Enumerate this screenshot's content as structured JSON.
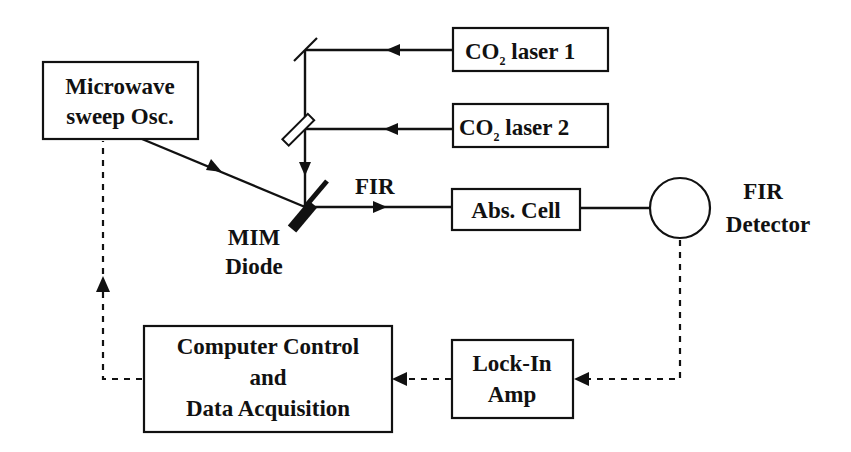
{
  "diagram": {
    "type": "experimental-setup-block-diagram",
    "colors": {
      "ink": "#111111",
      "background": "#ffffff"
    },
    "nodes": {
      "microwave": {
        "line1": "Microwave",
        "line2": "sweep Osc."
      },
      "laser1": {
        "prefix": "CO",
        "sub": "2",
        "suffix": " laser 1"
      },
      "laser2": {
        "prefix": "CO",
        "sub": "2",
        "suffix": " laser 2"
      },
      "mim": {
        "line1": "MIM",
        "line2": "Diode"
      },
      "fir_beam": {
        "label": "FIR"
      },
      "abs_cell": {
        "label": "Abs. Cell"
      },
      "detector": {
        "line1": "FIR",
        "line2": "Detector"
      },
      "lockin": {
        "line1": "Lock-In",
        "line2": "Amp"
      },
      "computer": {
        "line1": "Computer Control",
        "line2": "and",
        "line3": "Data Acquisition"
      }
    },
    "edges": [
      {
        "from": "laser1",
        "to": "mirror",
        "style": "solid",
        "arrow": "left"
      },
      {
        "from": "laser2",
        "to": "beamsplitter",
        "style": "solid",
        "arrow": "left"
      },
      {
        "from": "mirror",
        "to": "mim",
        "style": "solid",
        "arrow": "down"
      },
      {
        "from": "microwave",
        "to": "mim",
        "style": "solid",
        "arrow": "diagonal"
      },
      {
        "from": "mim",
        "to": "abs_cell",
        "style": "solid",
        "arrow": "right",
        "label": "FIR"
      },
      {
        "from": "abs_cell",
        "to": "detector",
        "style": "solid"
      },
      {
        "from": "detector",
        "to": "lockin",
        "style": "dashed",
        "arrow": "left"
      },
      {
        "from": "lockin",
        "to": "computer",
        "style": "dashed",
        "arrow": "left"
      },
      {
        "from": "computer",
        "to": "microwave",
        "style": "dashed",
        "arrow": "up"
      }
    ]
  }
}
